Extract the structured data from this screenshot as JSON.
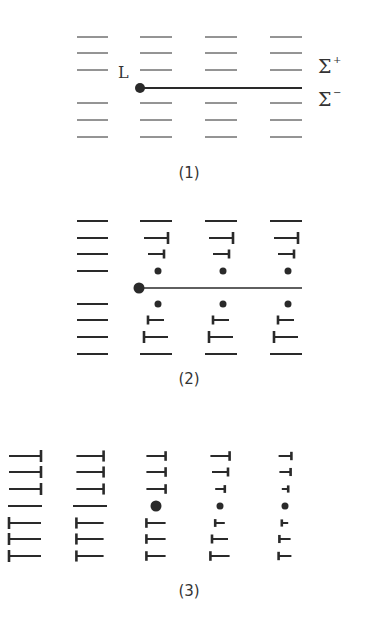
{
  "figure": {
    "ink_color": "#2a2a2a",
    "panels": [
      {
        "id": 1,
        "label": "(1)",
        "description": "Perfect lattice with a dislocation line L separating surfaces Σ+ (above) and Σ− (below)",
        "dislocation_label": "L",
        "surface_labels": {
          "upper": "Σ",
          "upper_sup": "+",
          "lower": "Σ",
          "lower_sup": "−"
        },
        "columns": 4,
        "rows_above": 3,
        "rows_below": 3,
        "columns_spec": [
          {
            "above": [
              "line",
              "line",
              "line"
            ],
            "below": [
              "line",
              "line",
              "line"
            ]
          },
          {
            "above": [
              "line",
              "line",
              "line"
            ],
            "below": [
              "line",
              "line",
              "line"
            ]
          },
          {
            "above": [
              "line",
              "line",
              "line"
            ],
            "below": [
              "line",
              "line",
              "line"
            ]
          },
          {
            "above": [
              "line",
              "line",
              "line"
            ],
            "below": [
              "line",
              "line",
              "line"
            ]
          }
        ]
      },
      {
        "id": 2,
        "label": "(2)",
        "description": "Lattice planes cut and displaced behind line L: points and T-shaped ends appear",
        "columns_spec": [
          {
            "above": [
              "line",
              "line",
              "line",
              "line"
            ],
            "below": [
              "line",
              "line",
              "line",
              "line"
            ]
          },
          {
            "above": [
              "line",
              "tee-l",
              "tee-s",
              "dot"
            ],
            "below": [
              "dot",
              "tee-s",
              "tee-l",
              "line"
            ]
          },
          {
            "above": [
              "line",
              "tee-l",
              "tee-s",
              "dot"
            ],
            "below": [
              "dot",
              "tee-s",
              "tee-l",
              "line"
            ]
          },
          {
            "above": [
              "line",
              "tee-l",
              "tee-s",
              "dot"
            ],
            "below": [
              "dot",
              "tee-s",
              "tee-l",
              "line"
            ]
          }
        ]
      },
      {
        "id": 3,
        "label": "(3)",
        "description": "Final configuration: progressive shrinkage of defects across columns",
        "columns_spec": [
          {
            "mid": "line",
            "above": [
              1.0,
              1.0,
              1.0
            ],
            "below": [
              1.0,
              1.0,
              1.0
            ]
          },
          {
            "mid": "line",
            "above": [
              0.85,
              0.85,
              0.85
            ],
            "below": [
              0.85,
              0.85,
              0.85
            ]
          },
          {
            "mid": "dot-l",
            "above": [
              0.6,
              0.6,
              0.6
            ],
            "below": [
              0.6,
              0.6,
              0.6
            ]
          },
          {
            "mid": "dot-m",
            "above": [
              0.6,
              0.5,
              0.3
            ],
            "below": [
              0.3,
              0.5,
              0.6
            ]
          },
          {
            "mid": "dot-m",
            "above": [
              0.4,
              0.35,
              0.2
            ],
            "below": [
              0.2,
              0.35,
              0.4
            ]
          }
        ]
      }
    ]
  }
}
